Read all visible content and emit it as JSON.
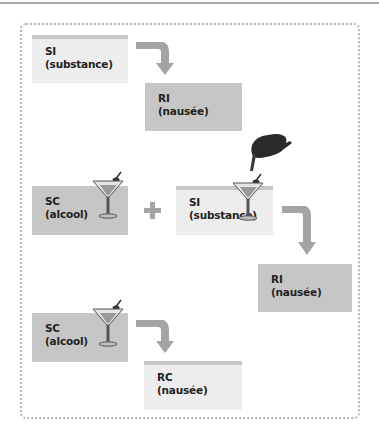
{
  "diagram": {
    "colors": {
      "box_light": "#ededed",
      "box_dark": "#c6c6c6",
      "arrow": "#a4a4a4",
      "frame_dots": "#b5b5b5"
    },
    "stage1": {
      "stimulus": {
        "code": "SI",
        "label": "(substance)"
      },
      "response": {
        "code": "RI",
        "label": "(nausée)"
      }
    },
    "stage2": {
      "conditioned_stimulus": {
        "code": "SC",
        "label": "(alcool)"
      },
      "operator": "+",
      "stimulus": {
        "code": "SI",
        "label": "(substance)"
      },
      "response": {
        "code": "RI",
        "label": "(nausée)"
      }
    },
    "stage3": {
      "conditioned_stimulus": {
        "code": "SC",
        "label": "(alcool)"
      },
      "response": {
        "code": "RC",
        "label": "(nausée)"
      }
    },
    "icons": [
      "martini-glass-icon",
      "hand-dropper-icon",
      "curved-arrow-icon",
      "plus-icon"
    ]
  }
}
